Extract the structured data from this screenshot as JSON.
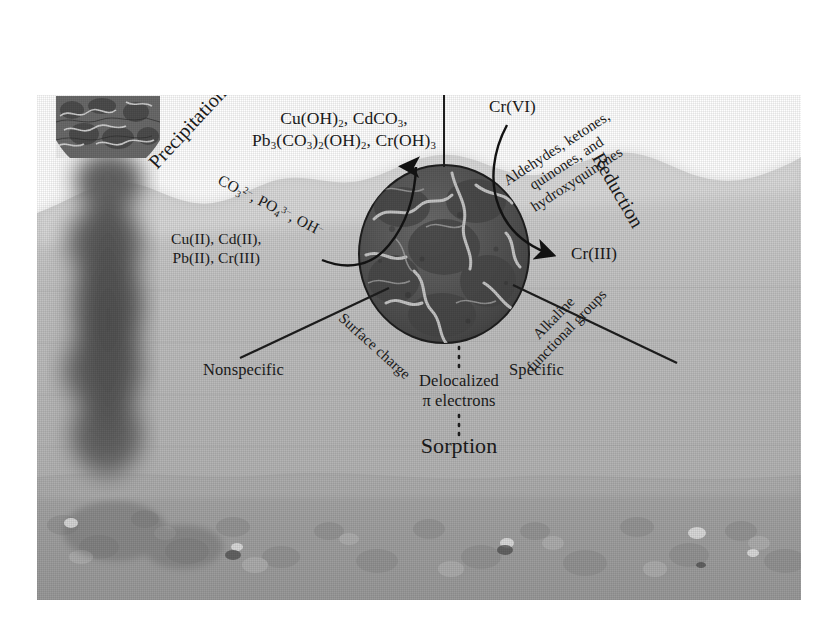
{
  "figure": {
    "type": "scientific-schematic",
    "background_color": "#ffffff",
    "ink_color": "#1b1b1b"
  },
  "scene": {
    "air_label": "air",
    "water_label": "water",
    "sediment_label": "sediment bed",
    "plume_label": "biochar plume",
    "particle_label": "biochar particle"
  },
  "processes": {
    "precipitation": "Precipitation",
    "reduction": "Reduction",
    "sorption": "Sorption"
  },
  "precipitation_branch": {
    "products_line1": "Cu(OH)2, CdCO3,",
    "products_line2": "Pb3(CO3)2(OH)2, Cr(OH)3",
    "anions": "CO3 2-, PO4 3-, OH-",
    "metals_line1": "Cu(II), Cd(II),",
    "metals_line2": "Pb(II), Cr(III)"
  },
  "reduction_branch": {
    "reactant": "Cr(VI)",
    "product": "Cr(III)",
    "agents_line1": "Aldehydes, ketones,",
    "agents_line2": "quinones, and",
    "agents_line3": "hydroxyquinones"
  },
  "sorption_branch": {
    "left_mechanism": "Surface charge",
    "right_mechanism_line1": "Alkaline",
    "right_mechanism_line2": "functional groups",
    "left_type": "Nonspecific",
    "right_type": "Specific",
    "center_line1": "Delocalized",
    "center_line2": "π electrons",
    "title": "Sorption"
  },
  "colors": {
    "water": "#b9b9b9",
    "water_light": "#cfcfcf",
    "sediment": "#a6a6a6",
    "particle_dark": "#4a4a4a",
    "particle_mid": "#5d5d5d",
    "particle_light": "#9a9a9a",
    "plume": "#555555",
    "ink": "#1b1b1b"
  }
}
